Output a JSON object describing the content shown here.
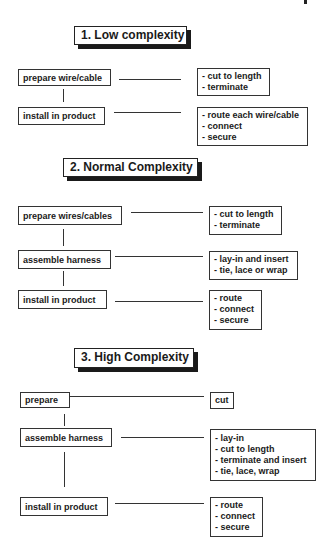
{
  "sections": [
    {
      "title": "1.  Low complexity",
      "steps": [
        {
          "label": "prepare wire/cable",
          "details": [
            "- cut to length",
            "- terminate"
          ]
        },
        {
          "label": "install in product",
          "details": [
            "- route each wire/cable",
            "- connect",
            "- secure"
          ]
        }
      ]
    },
    {
      "title": "2.  Normal Complexity",
      "steps": [
        {
          "label": "prepare wires/cables",
          "details": [
            "- cut to length",
            "- terminate"
          ]
        },
        {
          "label": "assemble harness",
          "details": [
            "- lay-in and insert",
            "- tie, lace or wrap"
          ]
        },
        {
          "label": "install in product",
          "details": [
            "- route",
            "- connect",
            "- secure"
          ]
        }
      ]
    },
    {
      "title": "3.  High Complexity",
      "steps": [
        {
          "label": "prepare",
          "details": [
            "cut"
          ]
        },
        {
          "label": "assemble harness",
          "details": [
            "- lay-in",
            "- cut to length",
            "- terminate and insert",
            "- tie, lace, wrap"
          ]
        },
        {
          "label": "install in product",
          "details": [
            "- route",
            "- connect",
            "- secure"
          ]
        }
      ]
    }
  ]
}
